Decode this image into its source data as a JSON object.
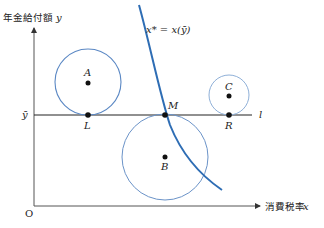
{
  "diagram": {
    "y_axis_label": "年金給付額",
    "y_axis_var": "y",
    "x_axis_label": "消費税率",
    "x_axis_var": "x",
    "origin_label": "O",
    "ybar_label": "ȳ",
    "line_label": "l",
    "curve_label": "x* = x(ȳ)",
    "points": {
      "A": "A",
      "B": "B",
      "C": "C",
      "L": "L",
      "M": "M",
      "R": "R"
    },
    "colors": {
      "axis": "#333333",
      "curve": "#2e6db4",
      "circle": "#5b88c4",
      "circle_light": "#8fb0d8",
      "point": "#111111"
    }
  }
}
